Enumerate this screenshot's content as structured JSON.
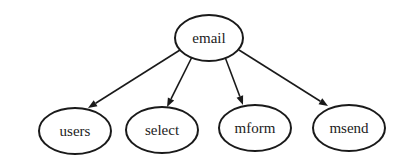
{
  "diagram": {
    "type": "tree",
    "root": {
      "id": "email",
      "label": "email",
      "cx": 209,
      "cy": 38,
      "rx": 34,
      "ry": 23
    },
    "children": [
      {
        "id": "users",
        "label": "users",
        "cx": 75,
        "cy": 131,
        "rx": 36,
        "ry": 23
      },
      {
        "id": "select",
        "label": "select",
        "cx": 162,
        "cy": 130,
        "rx": 36,
        "ry": 23
      },
      {
        "id": "mform",
        "label": "mform",
        "cx": 255,
        "cy": 128,
        "rx": 36,
        "ry": 23
      },
      {
        "id": "msend",
        "label": "msend",
        "cx": 349,
        "cy": 128,
        "rx": 36,
        "ry": 23
      }
    ],
    "edges": [
      {
        "from": "email",
        "to": "users",
        "x1": 180,
        "y1": 50,
        "x2": 88,
        "y2": 108
      },
      {
        "from": "email",
        "to": "select",
        "x1": 192,
        "y1": 57,
        "x2": 167,
        "y2": 107
      },
      {
        "from": "email",
        "to": "mform",
        "x1": 225,
        "y1": 57,
        "x2": 243,
        "y2": 105
      },
      {
        "from": "email",
        "to": "msend",
        "x1": 239,
        "y1": 50,
        "x2": 328,
        "y2": 106
      }
    ]
  }
}
